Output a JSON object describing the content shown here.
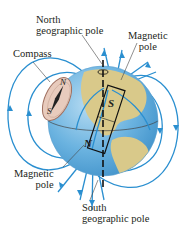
{
  "diagram": {
    "type": "earth-magnetic-field",
    "labels": {
      "north_geo_line1": "North",
      "north_geo_line2": "geographic pole",
      "mag_pole_top_line1": "Magnetic",
      "mag_pole_top_line2": "pole",
      "compass": "Compass",
      "mag_pole_bottom_line1": "Magnetic",
      "mag_pole_bottom_line2": "pole",
      "south_geo_line1": "South",
      "south_geo_line2": "geographic pole"
    },
    "magnet": {
      "top_letter": "S",
      "bottom_letter": "N"
    },
    "compass_needle": {
      "north_letter": "N",
      "south_letter": "S"
    },
    "colors": {
      "field_lines": "#2a8fd0",
      "ocean": "#6bb3e0",
      "ocean_dark": "#3d8fc8",
      "land": "#d9c98a",
      "compass_fill": "#e8cbbd",
      "compass_edge": "#a07060",
      "axis": "#111111",
      "text": "#231f20"
    }
  }
}
